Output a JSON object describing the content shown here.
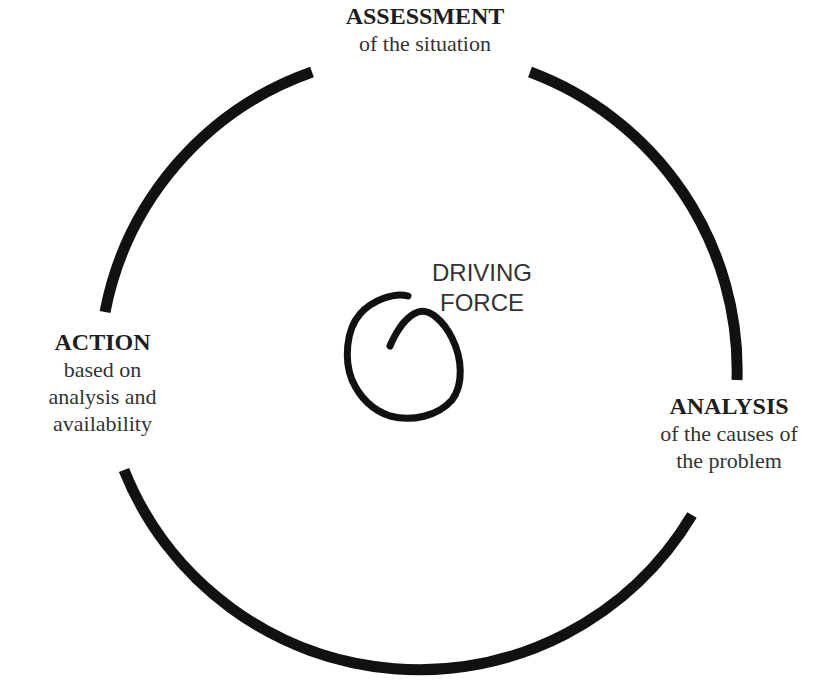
{
  "diagram": {
    "type": "cycle",
    "stages": [
      {
        "title": "ASSESSMENT",
        "desc": [
          "of the situation"
        ],
        "position": "top"
      },
      {
        "title": "ANALYSIS",
        "desc": [
          "of the causes of",
          "the problem"
        ],
        "position": "right"
      },
      {
        "title": "ACTION",
        "desc": [
          "based on",
          "analysis and",
          "availability"
        ],
        "position": "left"
      }
    ],
    "center": {
      "label_line1": "DRIVING",
      "label_line2": "FORCE",
      "icon": "spiral-icon"
    },
    "colors": {
      "stroke": "#111111",
      "text": "#2a2a2a",
      "background": "#ffffff"
    }
  }
}
